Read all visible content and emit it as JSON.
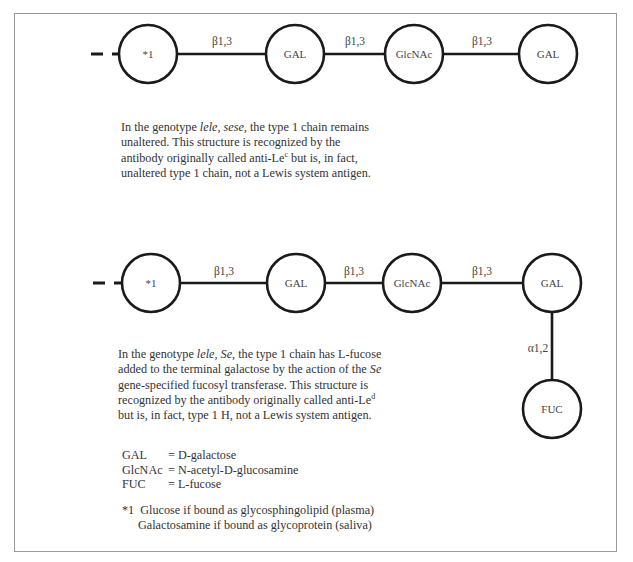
{
  "figure": {
    "clipped_caption": "Figure 1. Lewis antigen genotype structures"
  },
  "diagram_top": {
    "dash_label": "non-reducing chain continuation",
    "nodes": [
      {
        "id": "t1",
        "label": "*1"
      },
      {
        "id": "t2",
        "label": "GAL"
      },
      {
        "id": "t3",
        "label": "GlcNAc"
      },
      {
        "id": "t4",
        "label": "GAL"
      }
    ],
    "bonds": [
      {
        "label": "β1,3"
      },
      {
        "label": "β1,3"
      },
      {
        "label": "β1,3"
      }
    ],
    "description": {
      "p1": "In the genotype ",
      "genotype": "lele, sese",
      "p2": ", the type 1 chain remains",
      "line2": "unaltered.  This structure is recognized by the",
      "line3a": "antibody originally called anti-Le",
      "line3sup": "c",
      "line3b": " but is, in fact,",
      "line4": "unaltered type 1 chain, not a Lewis system antigen."
    }
  },
  "diagram_bottom": {
    "nodes": [
      {
        "id": "b1",
        "label": "*1"
      },
      {
        "id": "b2",
        "label": "GAL"
      },
      {
        "id": "b3",
        "label": "GlcNAc"
      },
      {
        "id": "b4",
        "label": "GAL"
      },
      {
        "id": "b5",
        "label": "FUC"
      }
    ],
    "bonds": [
      {
        "label": "β1,3"
      },
      {
        "label": "β1,3"
      },
      {
        "label": "β1,3"
      },
      {
        "label": "α1,2"
      }
    ],
    "description": {
      "p1": "In the genotype ",
      "genotype": "lele, Se",
      "p2": ", the type 1 chain has L-fucose",
      "line2a": "added to the terminal galactose by the action of the ",
      "line2gene": "Se",
      "line3": "gene-specified fucosyl transferase.  This structure is",
      "line4a": "recognized by the antibody originally called anti-Le",
      "line4sup": "d",
      "line5": "but is, in fact, type 1 H, not a Lewis system antigen."
    }
  },
  "legend": {
    "items": [
      {
        "abbr": "GAL",
        "meaning": "= D-galactose"
      },
      {
        "abbr": "GlcNAc",
        "meaning": "= N-acetyl-D-glucosamine"
      },
      {
        "abbr": "FUC",
        "meaning": "= L-fucose"
      }
    ]
  },
  "footnote": {
    "marker": "*1",
    "line1": "Glucose if bound as glycosphingolipid (plasma)",
    "line2": "Galactosamine if bound as glycoprotein (saliva)"
  },
  "colors": {
    "stroke": "#1a1a1a",
    "text": "#333333",
    "frame": "#9a9a9a",
    "background": "#ffffff"
  }
}
